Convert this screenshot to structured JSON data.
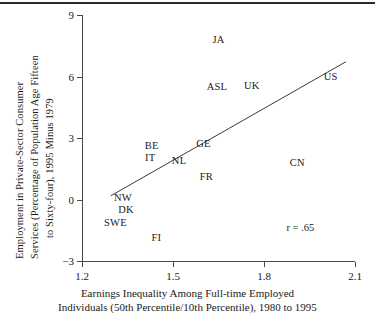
{
  "figure": {
    "top_rule": "horizontal-rule"
  },
  "chart_data": {
    "type": "scatter",
    "title": "",
    "xlabel_lines": [
      "Earnings Inequality Among Full-time Employed",
      "Individuals (50th Percentile/10th Percentile), 1980 to 1995"
    ],
    "ylabel_lines": [
      "Employment in Private-Sector Consumer",
      "Services (Percentage of Population Age Fifteen",
      "to Sixty-four), 1995 Minus 1979"
    ],
    "xlim": [
      1.2,
      2.1
    ],
    "ylim": [
      -3,
      9
    ],
    "xticks": [
      "1.2",
      "1.5",
      "1.8",
      "2.1"
    ],
    "xtick_values": [
      1.2,
      1.5,
      1.8,
      2.1
    ],
    "yticks": [
      "9",
      "6",
      "3",
      "0",
      "−3"
    ],
    "ytick_values": [
      9,
      6,
      3,
      0,
      -3
    ],
    "grid": false,
    "legend": "none",
    "annotations": [
      {
        "text": "r = .65",
        "x": 1.92,
        "y": -1.35
      }
    ],
    "trendline": {
      "type": "linear",
      "x_start": 1.295,
      "y_start": 0.18,
      "x_end": 2.07,
      "y_end": 6.72
    },
    "points": [
      {
        "label": "JA",
        "x": 1.65,
        "y": 7.85
      },
      {
        "label": "ASL",
        "x": 1.645,
        "y": 5.55
      },
      {
        "label": "UK",
        "x": 1.76,
        "y": 5.6
      },
      {
        "label": "US",
        "x": 2.02,
        "y": 6.02
      },
      {
        "label": "GE",
        "x": 1.6,
        "y": 2.75
      },
      {
        "label": "BE",
        "x": 1.43,
        "y": 2.65
      },
      {
        "label": "IT",
        "x": 1.425,
        "y": 2.05
      },
      {
        "label": "NL",
        "x": 1.52,
        "y": 1.93
      },
      {
        "label": "FR",
        "x": 1.61,
        "y": 1.15
      },
      {
        "label": "CN",
        "x": 1.91,
        "y": 1.82
      },
      {
        "label": "NW",
        "x": 1.335,
        "y": 0.1
      },
      {
        "label": "DK",
        "x": 1.345,
        "y": -0.45
      },
      {
        "label": "SWE",
        "x": 1.31,
        "y": -1.1
      },
      {
        "label": "FI",
        "x": 1.445,
        "y": -1.85
      }
    ]
  }
}
